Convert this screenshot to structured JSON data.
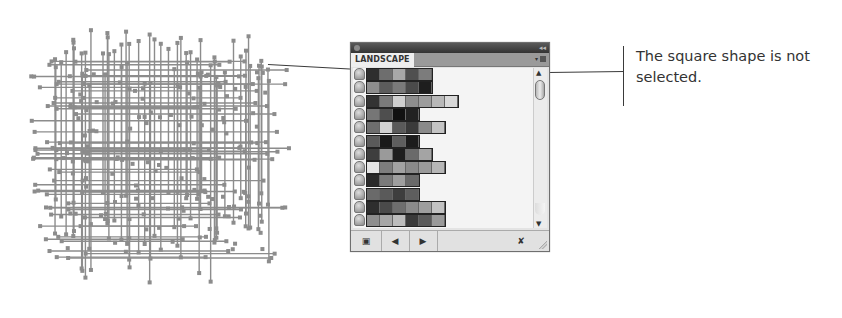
{
  "panel": {
    "tab_label": "LANDSCAPE",
    "collapse_glyph": "◂◂",
    "menu_glyph": "▾",
    "scroll_up_glyph": "▲",
    "scroll_down_glyph": "▼",
    "bottom_buttons": [
      {
        "name": "symbol-libraries-menu",
        "glyph": "▣"
      },
      {
        "name": "previous-library",
        "glyph": "◀"
      },
      {
        "name": "next-library",
        "glyph": "▶"
      },
      {
        "name": "delete-symbol",
        "glyph": "✘"
      }
    ],
    "rows": [
      [
        "#2e2e2e",
        "#6e6e6e",
        "#a8a8a8",
        "#505050",
        "#7c7c7c"
      ],
      [
        "#8e8e8e",
        "#5c5c5c",
        "#7a7a7a",
        "#4a4a4a",
        "#1e1e1e"
      ],
      [
        "#333333",
        "#7a7a7a",
        "#cfcfcf",
        "#8e8e8e",
        "#9c9c9c",
        "#b8b8b8",
        "#d8d8d8"
      ],
      [
        "#767676",
        "#4e4e4e",
        "#111111",
        "#222222"
      ],
      [
        "#6e6e6e",
        "#d2d2d2",
        "#5a5a5a",
        "#3a3a3a",
        "#8a8a8a",
        "#c4c4c4"
      ],
      [
        "#5a5a5a",
        "#1a1a1a",
        "#5e5e5e",
        "#1c1c1c"
      ],
      [
        "#3e3e3e",
        "#9a9a9a",
        "#1e1e1e",
        "#6a6a6a",
        "#a4a4a4"
      ],
      [
        "#e4e4e4",
        "#7e7e7e",
        "#a2a2a2",
        "#8a8a8a",
        "#9a9a9a",
        "#b6b6b6"
      ],
      [
        "#2a2a2a",
        "#7a7a7a",
        "#9e9e9e",
        "#6a6a6a"
      ],
      [
        "#6a6a6a",
        "#5a5a5a",
        "#3e3e3e",
        "#5e5e5e"
      ],
      [
        "#2e2e2e",
        "#4a4a4a",
        "#6e6e6e",
        "#8a8a8a",
        "#9e9e9e",
        "#c2c2c2"
      ],
      [
        "#8e8e8e",
        "#a6a6a6",
        "#bcbcbc",
        "#3a3a3a",
        "#5a5a5a",
        "#9a9a9a"
      ]
    ]
  },
  "callout": {
    "text": "The square shape is not selected."
  }
}
